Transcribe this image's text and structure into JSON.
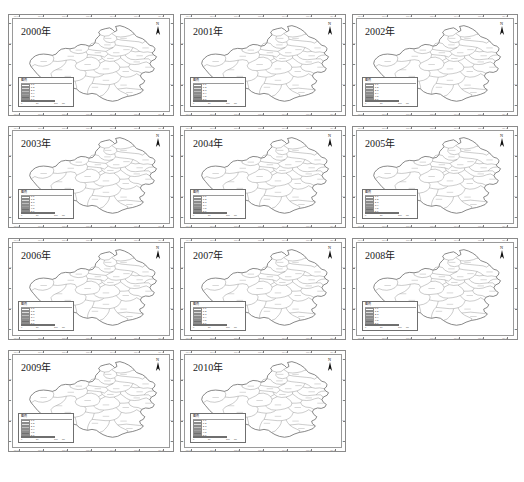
{
  "figure": {
    "panel_count": 11,
    "columns": 3,
    "rows": 4,
    "background_color": "#ffffff",
    "outline_color": "#8a8a8a"
  },
  "panels": [
    {
      "year_label": "2000年"
    },
    {
      "year_label": "2001年"
    },
    {
      "year_label": "2002年"
    },
    {
      "year_label": "2003年"
    },
    {
      "year_label": "2004年"
    },
    {
      "year_label": "2005年"
    },
    {
      "year_label": "2006年"
    },
    {
      "year_label": "2007年"
    },
    {
      "year_label": "2008年"
    },
    {
      "year_label": "2009年"
    },
    {
      "year_label": "2010年"
    }
  ],
  "north_arrow": {
    "letter": "N",
    "icon": "north-arrow-icon"
  },
  "legend": {
    "title": "图例",
    "classes": [
      {
        "label": "0-1",
        "color": "#ffffff"
      },
      {
        "label": "1-2",
        "color": "#dcdcdc"
      },
      {
        "label": "2-3",
        "color": "#bdbdbd"
      },
      {
        "label": "3-4",
        "color": "#9e9e9e"
      },
      {
        "label": "4-5",
        "color": "#6f6f6f"
      },
      {
        "label": "5-6",
        "color": "#3f3f3f"
      }
    ]
  },
  "scale_bar": {
    "ticks": [
      "0",
      "50",
      "100"
    ],
    "unit": "km"
  },
  "graticule": {
    "top_labels": [
      "110°E",
      "111°E",
      "112°E",
      "113°E",
      "114°E",
      "115°E",
      "116°E"
    ],
    "bottom_labels": [
      "110°E",
      "111°E",
      "112°E",
      "113°E",
      "114°E",
      "115°E",
      "116°E"
    ],
    "left_labels": [
      "36°N",
      "35°N",
      "34°N",
      "33°N",
      "32°N"
    ],
    "right_labels": [
      "36°N",
      "35°N",
      "34°N",
      "33°N",
      "32°N"
    ]
  },
  "map": {
    "region_name": "Henan Province",
    "boundary_color": "#5a5a5a",
    "fill_color": "#ffffff",
    "district_label_color": "#a8a8a8"
  }
}
